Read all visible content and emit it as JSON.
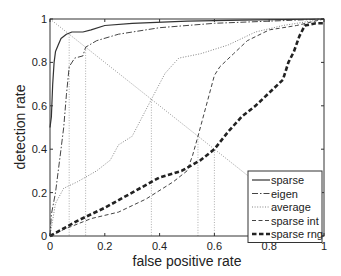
{
  "chart_data": {
    "type": "line",
    "title": "",
    "xlabel": "false positive rate",
    "ylabel": "detection rate",
    "xlim": [
      0,
      1
    ],
    "ylim": [
      0,
      1
    ],
    "xticks": [
      "0",
      "0.2",
      "0.4",
      "0.6",
      "0.8",
      "1"
    ],
    "yticks": [
      "0",
      "0.2",
      "0.4",
      "0.6",
      "0.8",
      "1"
    ],
    "grid": false,
    "legend_position": "lower right",
    "series": [
      {
        "name": "sparse",
        "style": "solid",
        "x": [
          0,
          0.005,
          0.01,
          0.015,
          0.02,
          0.03,
          0.04,
          0.06,
          0.08,
          0.12,
          0.15,
          0.2,
          0.3,
          0.5,
          0.7,
          1
        ],
        "y": [
          0.5,
          0.55,
          0.7,
          0.8,
          0.85,
          0.88,
          0.91,
          0.93,
          0.94,
          0.94,
          0.95,
          0.97,
          0.98,
          0.99,
          0.995,
          1
        ]
      },
      {
        "name": "eigen",
        "style": "dashdot",
        "x": [
          0,
          0.005,
          0.02,
          0.04,
          0.05,
          0.06,
          0.07,
          0.09,
          0.12,
          0.13,
          0.17,
          0.25,
          0.4,
          0.6,
          1
        ],
        "y": [
          0,
          0.1,
          0.2,
          0.4,
          0.5,
          0.65,
          0.78,
          0.82,
          0.83,
          0.87,
          0.9,
          0.93,
          0.96,
          0.98,
          1
        ]
      },
      {
        "name": "average",
        "style": "dotted",
        "x": [
          0,
          0.02,
          0.05,
          0.1,
          0.17,
          0.22,
          0.25,
          0.3,
          0.37,
          0.42,
          0.47,
          0.55,
          0.65,
          0.75,
          0.85,
          1
        ],
        "y": [
          0,
          0.15,
          0.22,
          0.25,
          0.3,
          0.35,
          0.42,
          0.46,
          0.63,
          0.75,
          0.82,
          0.84,
          0.88,
          0.94,
          0.97,
          1
        ]
      },
      {
        "name": "sparse int",
        "style": "dashed",
        "x": [
          0,
          0.05,
          0.15,
          0.25,
          0.35,
          0.45,
          0.5,
          0.52,
          0.54,
          0.57,
          0.6,
          0.62,
          0.67,
          0.72,
          0.8,
          0.9,
          1
        ],
        "y": [
          0,
          0.03,
          0.08,
          0.11,
          0.17,
          0.25,
          0.3,
          0.37,
          0.46,
          0.6,
          0.74,
          0.78,
          0.84,
          0.9,
          0.95,
          0.97,
          1
        ]
      },
      {
        "name": "sparse rng",
        "style": "thick-dashed",
        "x": [
          0,
          0.1,
          0.2,
          0.3,
          0.4,
          0.48,
          0.55,
          0.6,
          0.65,
          0.7,
          0.75,
          0.8,
          0.85,
          0.87,
          0.89,
          0.91,
          0.93,
          0.97,
          1
        ],
        "y": [
          0,
          0.07,
          0.13,
          0.2,
          0.27,
          0.3,
          0.35,
          0.4,
          0.48,
          0.55,
          0.6,
          0.66,
          0.72,
          0.8,
          0.85,
          0.92,
          0.97,
          0.98,
          0.98
        ]
      }
    ],
    "annotations": {
      "diagonal": {
        "from": [
          0,
          1
        ],
        "to": [
          1,
          0
        ],
        "style": "dotted"
      },
      "equal_error_vlines_x": [
        0.07,
        0.13,
        0.37,
        0.54,
        0.6
      ]
    }
  }
}
